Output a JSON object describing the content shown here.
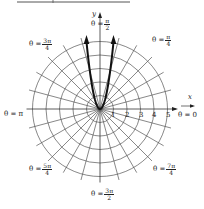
{
  "figure": {
    "type": "polar-graph",
    "axes": {
      "x_label": "x",
      "y_label": "y"
    },
    "radial_ticks": [
      "1",
      "2",
      "3",
      "4",
      "5"
    ],
    "angle_labels": [
      {
        "theta": "θ = ",
        "num": "π",
        "den": "2",
        "position": "top"
      },
      {
        "theta": "θ = ",
        "num": "π",
        "den": "4",
        "position": "top-right"
      },
      {
        "theta": "θ = ",
        "num": "3π",
        "den": "4",
        "position": "top-left"
      },
      {
        "theta": "θ = π",
        "num": "",
        "den": "",
        "position": "left"
      },
      {
        "theta": "θ = 0",
        "num": "",
        "den": "",
        "position": "right"
      },
      {
        "theta": "θ = ",
        "num": "5π",
        "den": "4",
        "position": "bottom-left"
      },
      {
        "theta": "θ = ",
        "num": "7π",
        "den": "4",
        "position": "bottom-right"
      },
      {
        "theta": "θ = ",
        "num": "3π",
        "den": "2",
        "position": "bottom"
      }
    ],
    "grid": {
      "circles": 5,
      "radial_step_degrees": 15
    },
    "curve": {
      "description": "U-shaped (parabola-like) curve through the pole opening upward, with arrowheads at both ends",
      "color": "#111111"
    }
  }
}
